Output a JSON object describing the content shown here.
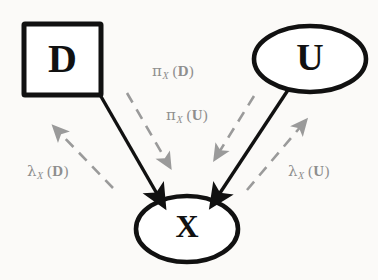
{
  "figure": {
    "background_color": "#fbfaf8",
    "node_stroke_color": "#111111",
    "solid_edge_color": "#111111",
    "dashed_edge_color": "#9a9a9a",
    "label_color": "#8e8e8e"
  },
  "nodes": [
    {
      "id": "D",
      "label": "D",
      "shape": "rectangle",
      "x": 23,
      "y": 23,
      "width": 79,
      "height": 73
    },
    {
      "id": "U",
      "label": "U",
      "shape": "ellipse",
      "cx": 310,
      "cy": 59,
      "rx": 58,
      "ry": 34
    },
    {
      "id": "X",
      "label": "X",
      "shape": "ellipse",
      "cx": 187,
      "cy": 229,
      "rx": 53,
      "ry": 34
    }
  ],
  "edges": [
    {
      "id": "D-to-X",
      "from": "D",
      "to": "X",
      "style": "solid",
      "arrow": "to"
    },
    {
      "id": "U-to-X",
      "from": "U",
      "to": "X",
      "style": "solid",
      "arrow": "to"
    }
  ],
  "messages": [
    {
      "id": "pi-x-d",
      "greek": "π",
      "subscript": "X",
      "argument": "D",
      "direction": "D-to-X",
      "style": "dashed",
      "label_x": 152,
      "label_y": 62
    },
    {
      "id": "pi-x-u",
      "greek": "π",
      "subscript": "X",
      "argument": "U",
      "direction": "U-to-X",
      "style": "dashed",
      "label_x": 166,
      "label_y": 106
    },
    {
      "id": "lambda-x-d",
      "greek": "λ",
      "subscript": "X",
      "argument": "D",
      "direction": "X-to-D",
      "style": "dashed",
      "label_x": 27,
      "label_y": 162
    },
    {
      "id": "lambda-x-u",
      "greek": "λ",
      "subscript": "X",
      "argument": "U",
      "direction": "X-to-U",
      "style": "dashed",
      "label_x": 288,
      "label_y": 162
    }
  ]
}
